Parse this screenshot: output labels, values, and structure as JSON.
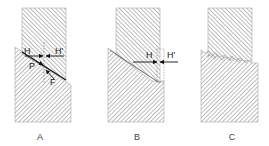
{
  "diagram": {
    "panels": [
      {
        "id": "A",
        "label": "A",
        "force_labels": [
          "H",
          "H'",
          "P",
          "F"
        ]
      },
      {
        "id": "B",
        "label": "B",
        "force_labels": [
          "H",
          "H'"
        ]
      },
      {
        "id": "C",
        "label": "C",
        "force_labels": []
      }
    ],
    "colors": {
      "hatch": "#666666",
      "outline": "#555555",
      "arrow": "#111111",
      "background": "#ffffff"
    }
  }
}
